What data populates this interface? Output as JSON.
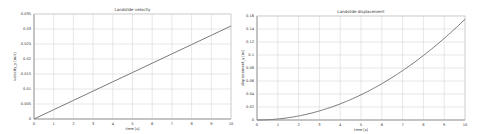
{
  "chart_data": [
    {
      "type": "line",
      "title": "Landslide velocity",
      "xlabel": "time [s]",
      "ylabel": "velocity_y [m/s]",
      "xlim": [
        0,
        10
      ],
      "ylim": [
        0,
        0.035
      ],
      "x_ticks": [
        "0",
        "1",
        "2",
        "3",
        "4",
        "5",
        "6",
        "7",
        "8",
        "9",
        "10"
      ],
      "y_ticks": [
        "0",
        "0.005",
        "0.01",
        "0.015",
        "0.02",
        "0.025",
        "0.03",
        "0.035"
      ],
      "grid": true,
      "legend": null,
      "series": [
        {
          "name": "velocity",
          "x": [
            0,
            1,
            2,
            3,
            4,
            5,
            6,
            7,
            8,
            9,
            10
          ],
          "y": [
            0,
            0.0031,
            0.0062,
            0.0093,
            0.0124,
            0.0155,
            0.0186,
            0.0217,
            0.0248,
            0.0279,
            0.031
          ]
        }
      ]
    },
    {
      "type": "line",
      "title": "Landslide displacement",
      "xlabel": "time [s]",
      "ylabel": "displacement_y [m]",
      "xlim": [
        0,
        10
      ],
      "ylim": [
        0,
        0.16
      ],
      "x_ticks": [
        "0",
        "1",
        "2",
        "3",
        "4",
        "5",
        "6",
        "7",
        "8",
        "9",
        "10"
      ],
      "y_ticks": [
        "0",
        "0.02",
        "0.04",
        "0.06",
        "0.08",
        "0.1",
        "0.12",
        "0.14",
        "0.16"
      ],
      "grid": true,
      "legend": null,
      "series": [
        {
          "name": "displacement",
          "x": [
            0,
            1,
            2,
            3,
            4,
            5,
            6,
            7,
            8,
            9,
            10
          ],
          "y": [
            0,
            0.00155,
            0.0062,
            0.01395,
            0.0248,
            0.03875,
            0.0558,
            0.07595,
            0.0992,
            0.12555,
            0.155
          ]
        }
      ]
    }
  ]
}
